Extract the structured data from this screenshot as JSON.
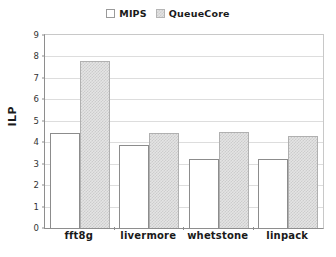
{
  "chart_data": {
    "type": "bar",
    "title": "",
    "xlabel": "",
    "ylabel": "ILP",
    "categories": [
      "fft8g",
      "livermore",
      "whetstone",
      "linpack"
    ],
    "series": [
      {
        "name": "MIPS",
        "values": [
          4.42,
          3.88,
          3.23,
          3.23
        ],
        "color": "#ffffff"
      },
      {
        "name": "QueueCore",
        "values": [
          7.77,
          4.42,
          4.47,
          4.3
        ],
        "color": "#e0e0e0"
      }
    ],
    "ylim": [
      0,
      9
    ],
    "ytick_step": 1,
    "yticks": [
      "0",
      "1",
      "2",
      "3",
      "4",
      "5",
      "6",
      "7",
      "8",
      "9"
    ],
    "grid": true,
    "legend_position": "top-center"
  },
  "legend": {
    "entries": [
      {
        "label": "MIPS",
        "swatch": "open-square-swatch"
      },
      {
        "label": "QueueCore",
        "swatch": "hatched-square-swatch"
      }
    ]
  }
}
